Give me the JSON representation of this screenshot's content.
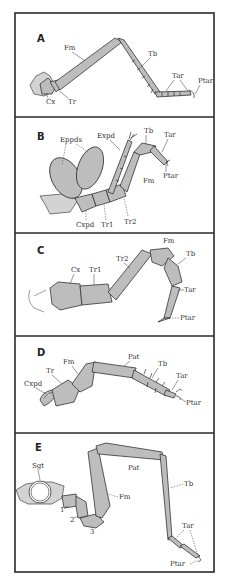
{
  "figure": {
    "type": "arthropod leg morphology comparison",
    "panels": [
      {
        "id": "A",
        "label": "A",
        "segments": {
          "fm": "Fm",
          "tb": "Tb",
          "tar": "Tar",
          "ptar": "Ptar",
          "cx": "Cx",
          "tr": "Tr"
        }
      },
      {
        "id": "B",
        "label": "B",
        "segments": {
          "eppds": "Eppds",
          "expd": "Expd",
          "tb": "Tb",
          "tar": "Tar",
          "ptar": "Ptar",
          "fm": "Fm",
          "cxpd": "Cxpd",
          "tr1": "Tr1",
          "tr2": "Tr2"
        }
      },
      {
        "id": "C",
        "label": "C",
        "segments": {
          "cx": "Cx",
          "tr1": "Tr1",
          "tr2": "Tr2",
          "fm": "Fm",
          "tb": "Tb",
          "tar": "Tar",
          "ptar": "Ptar"
        }
      },
      {
        "id": "D",
        "label": "D",
        "segments": {
          "cxpd": "Cxpd",
          "tr": "Tr",
          "fm": "Fm",
          "pat": "Pat",
          "tb": "Tb",
          "tar": "Tar",
          "ptar": "Ptar"
        }
      },
      {
        "id": "E",
        "label": "E",
        "segments": {
          "sgt": "Sgt",
          "s1": "1",
          "s2": "2",
          "s3": "3",
          "fm": "Fm",
          "pat": "Pat",
          "tb": "Tb",
          "tar": "Tar",
          "ptar": "Ptar"
        }
      }
    ]
  },
  "colors": {
    "segment_fill": "#bdbdbd",
    "outline": "#333333",
    "frame": "#2a2a2a",
    "background": "#ffffff"
  }
}
